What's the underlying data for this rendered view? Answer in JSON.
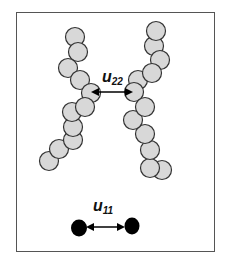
{
  "labels": {
    "u22": {
      "main": "u",
      "sub": "22"
    },
    "u11": {
      "main": "u",
      "sub": "11"
    }
  },
  "colors": {
    "bead_fill": "#d8d8d8",
    "bead_stroke": "#333333",
    "solid_bead": "#000000",
    "arrow": "#000000",
    "frame": "#555555"
  },
  "diagram": {
    "left_chain_beads": [
      [
        75,
        37
      ],
      [
        78,
        52
      ],
      [
        68,
        68
      ],
      [
        80,
        80
      ],
      [
        91,
        93
      ],
      [
        85,
        107
      ],
      [
        72,
        112
      ],
      [
        73,
        127
      ],
      [
        73,
        140
      ],
      [
        59,
        149
      ],
      [
        49,
        161
      ]
    ],
    "right_chain_beads": [
      [
        156,
        31
      ],
      [
        154,
        46
      ],
      [
        160,
        60
      ],
      [
        152,
        73
      ],
      [
        138,
        80
      ],
      [
        134,
        92
      ],
      [
        145,
        107
      ],
      [
        133,
        120
      ],
      [
        145,
        134
      ],
      [
        150,
        150
      ],
      [
        150,
        168
      ],
      [
        162,
        170
      ]
    ],
    "solid_beads": [
      [
        79,
        228
      ],
      [
        132,
        225
      ]
    ]
  }
}
